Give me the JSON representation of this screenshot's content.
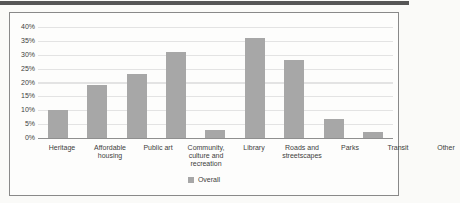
{
  "page": {
    "top_band_color": "#565656"
  },
  "chart_data": {
    "type": "bar",
    "title": "",
    "categories": [
      "Heritage",
      "Affordable housing",
      "Public art",
      "Community, culture and recreation",
      "Library",
      "Roads and streetscapes",
      "Parks",
      "Transit",
      "Other"
    ],
    "values": [
      10,
      19,
      23,
      31,
      3,
      36,
      28,
      7,
      2
    ],
    "series_name": "Overall",
    "xlabel": "",
    "ylabel": "",
    "ylim": [
      0,
      40
    ],
    "ytick_step": 5,
    "ytick_labels": [
      "40%",
      "35%",
      "30%",
      "25%",
      "20%",
      "15%",
      "10%",
      "5%",
      "0%"
    ],
    "grid": true,
    "bar_color": "#a7a7a7",
    "legend": {
      "position": "bottom",
      "label": "Overall",
      "marker_color": "#a7a7a7"
    }
  }
}
